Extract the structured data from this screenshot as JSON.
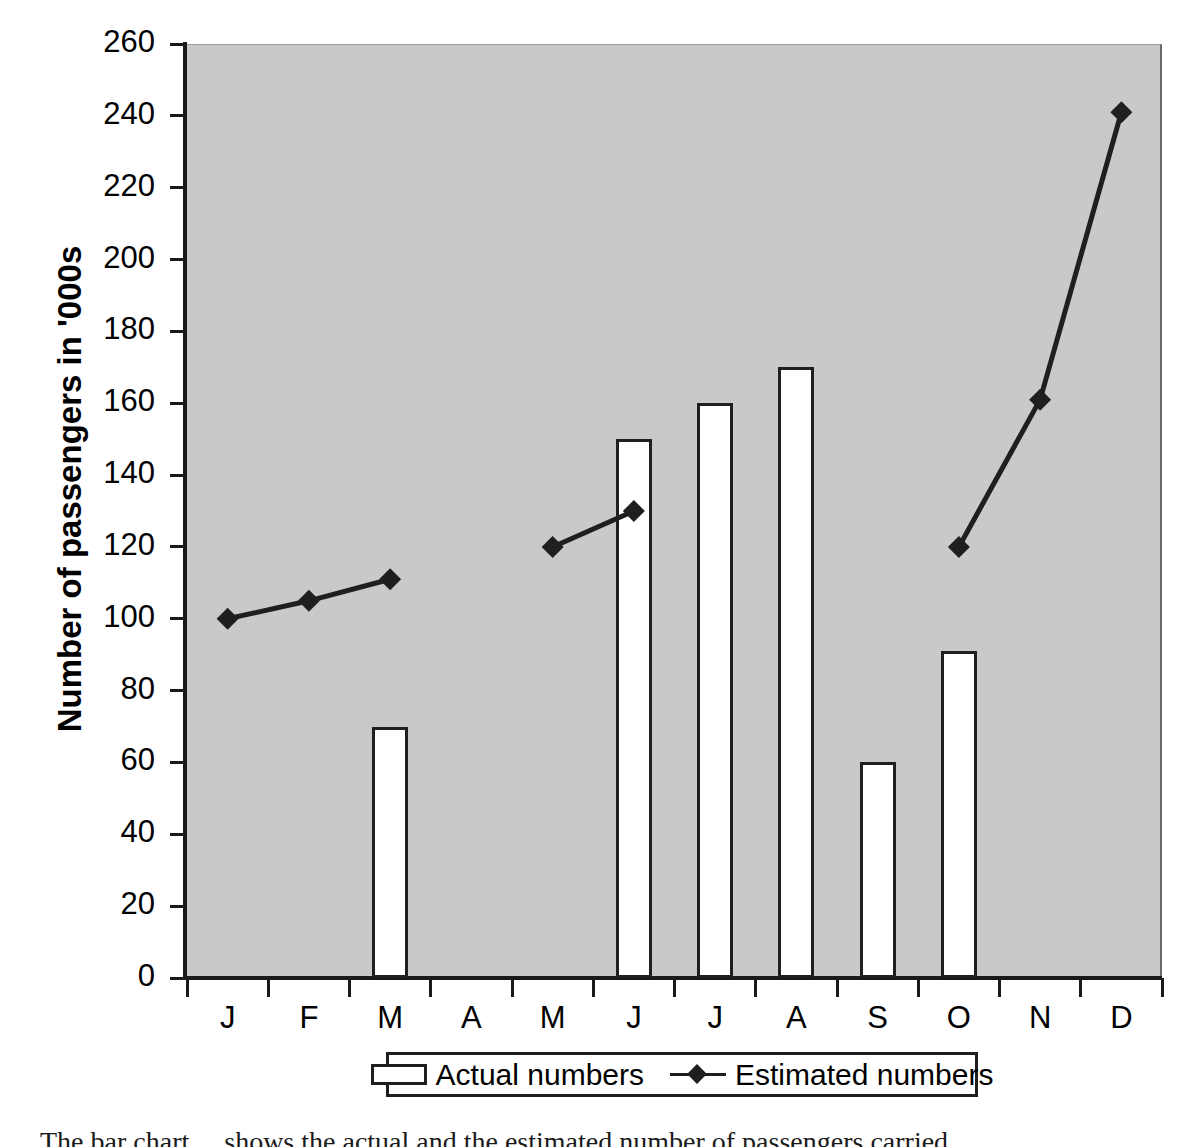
{
  "chart_data": {
    "type": "bar",
    "title": "",
    "xlabel": "",
    "ylabel": "Number of passengers in '000s",
    "ylim": [
      0,
      260
    ],
    "ytick_step": 20,
    "yticks": [
      0,
      20,
      40,
      60,
      80,
      100,
      120,
      140,
      160,
      180,
      200,
      220,
      240,
      260
    ],
    "categories": [
      "J",
      "F",
      "M",
      "A",
      "M",
      "J",
      "J",
      "A",
      "S",
      "O",
      "N",
      "D"
    ],
    "grid": false,
    "legend_position": "below-axis",
    "plot_background": "#c9c9c9",
    "series": [
      {
        "name": "Actual numbers",
        "type": "bar",
        "color": "#ffffff",
        "edge_color": "#1f1f1f",
        "values": [
          null,
          null,
          70,
          null,
          null,
          150,
          160,
          170,
          60,
          91,
          null,
          null
        ]
      },
      {
        "name": "Estimated numbers",
        "type": "line",
        "color": "#1f1f1f",
        "marker": "diamond",
        "values": [
          100,
          105,
          111,
          null,
          120,
          130,
          null,
          null,
          null,
          120,
          161,
          241
        ],
        "segments": [
          [
            0,
            1,
            2
          ],
          [
            4,
            5
          ],
          [
            9,
            10,
            11
          ]
        ]
      }
    ]
  },
  "legend": {
    "items": [
      {
        "label": "Actual numbers",
        "swatch": "bar-swatch"
      },
      {
        "label": "Estimated numbers",
        "swatch": "line-diamond-swatch"
      }
    ]
  },
  "caption": {
    "text": "The bar chart ... shows the actual and the estimated number of passengers carried ..."
  }
}
